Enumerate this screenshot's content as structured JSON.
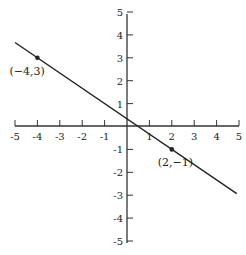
{
  "chart_data": {
    "type": "line",
    "title": "",
    "xlabel": "",
    "ylabel": "",
    "xlim": [
      -5,
      5
    ],
    "ylim": [
      -5,
      5
    ],
    "grid": false,
    "x_ticks": [
      -5,
      -4,
      -3,
      -2,
      -1,
      1,
      2,
      3,
      4,
      5
    ],
    "y_ticks": [
      5,
      4,
      3,
      2,
      1,
      -1,
      -2,
      -3,
      -4,
      -5
    ],
    "x_tick_labels": [
      "-5",
      "-4",
      "-3",
      "-2",
      "-1",
      "1",
      "2",
      "3",
      "4",
      "5"
    ],
    "y_tick_labels": [
      "5",
      "4",
      "3",
      "2",
      "1",
      "-1",
      "-2",
      "-3",
      "-4",
      "-5"
    ],
    "series": [
      {
        "name": "line through (-4,3) and (2,-1)",
        "slope": -0.6667,
        "intercept": 0.3333,
        "x": [
          -5,
          4.9
        ],
        "y": [
          3.67,
          -2.93
        ]
      }
    ],
    "points": [
      {
        "x": -4,
        "y": 3,
        "label": "(−4,3)"
      },
      {
        "x": 2,
        "y": -1,
        "label": "(2,−1)"
      }
    ],
    "colors": {
      "ink": "#222222",
      "background": "#ffffff"
    }
  }
}
